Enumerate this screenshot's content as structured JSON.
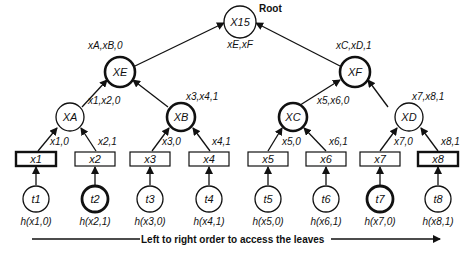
{
  "root": {
    "label": "X15",
    "tag": "Root",
    "below": "xE,xF"
  },
  "level2": [
    {
      "id": "XE",
      "label": "XE",
      "edge": "xA,xB,0",
      "bold": true
    },
    {
      "id": "XF",
      "label": "XF",
      "edge": "xC,xD,1",
      "bold": true
    }
  ],
  "level1": [
    {
      "id": "XA",
      "label": "XA",
      "edge": "x1,x2,0",
      "bold": false
    },
    {
      "id": "XB",
      "label": "XB",
      "edge": "x3,x4,1",
      "bold": true
    },
    {
      "id": "XC",
      "label": "XC",
      "edge": "x5,x6,0",
      "bold": true
    },
    {
      "id": "XD",
      "label": "XD",
      "edge": "x7,x8,1",
      "bold": false
    }
  ],
  "leaves": [
    {
      "box": "x1",
      "edge": "x1,0",
      "token": "t1",
      "hash": "h(x1,0)",
      "box_bold": true,
      "token_bold": false
    },
    {
      "box": "x2",
      "edge": "x2,1",
      "token": "t2",
      "hash": "h(x2,1)",
      "box_bold": false,
      "token_bold": true
    },
    {
      "box": "x3",
      "edge": "x3,0",
      "token": "t3",
      "hash": "h(x3,0)",
      "box_bold": false,
      "token_bold": false
    },
    {
      "box": "x4",
      "edge": "x4,1",
      "token": "t4",
      "hash": "h(x4,1)",
      "box_bold": false,
      "token_bold": false
    },
    {
      "box": "x5",
      "edge": "x5,0",
      "token": "t5",
      "hash": "h(x5,0)",
      "box_bold": false,
      "token_bold": false
    },
    {
      "box": "x6",
      "edge": "x6,1",
      "token": "t6",
      "hash": "h(x6,1)",
      "box_bold": false,
      "token_bold": false
    },
    {
      "box": "x7",
      "edge": "x7,0",
      "token": "t7",
      "hash": "h(x7,0)",
      "box_bold": false,
      "token_bold": true
    },
    {
      "box": "x8",
      "edge": "x8,1",
      "token": "t8",
      "hash": "h(x8,1)",
      "box_bold": true,
      "token_bold": false
    }
  ],
  "footer": {
    "caption": "Left to right order to access the leaves"
  }
}
